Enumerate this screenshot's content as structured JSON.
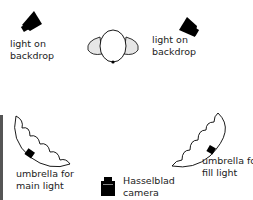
{
  "labels": {
    "light_left_1": "light on",
    "light_left_2": "backdrop",
    "light_right_1": "light on",
    "light_right_2": "backdrop",
    "umbrella_main_1": "umbrella for",
    "umbrella_main_2": "main light",
    "umbrella_fill_1": "umbrella for",
    "umbrella_fill_2": "fill light",
    "camera_1": "Hasselblad",
    "camera_2": "camera"
  },
  "colors": {
    "ink": "#000000",
    "subject_shade": "#e6e6e6",
    "backdrop": "#555555"
  }
}
